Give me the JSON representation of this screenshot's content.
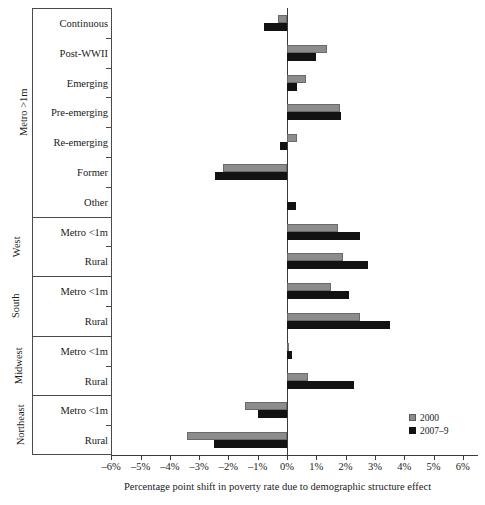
{
  "chart_data": {
    "type": "bar",
    "orientation": "horizontal",
    "title": "",
    "xlabel": "Percentage point shift in poverty rate due to demographic structure effect",
    "ylabel": "",
    "xlim": [
      -6.5,
      6.5
    ],
    "xticks": [
      "-6%",
      "-5%",
      "-4%",
      "-3%",
      "-2%",
      "-1%",
      "0%",
      "1%",
      "2%",
      "3%",
      "4%",
      "5%",
      "6%"
    ],
    "xtick_values": [
      -6,
      -5,
      -4,
      -3,
      -2,
      -1,
      0,
      1,
      2,
      3,
      4,
      5,
      6
    ],
    "grid": false,
    "legend_position": "bottom-right",
    "categories": [
      "Continuous",
      "Post-WWII",
      "Emerging",
      "Pre-emerging",
      "Re-emerging",
      "Former",
      "Other",
      "Metro <1m",
      "Rural",
      "Metro <1m",
      "Rural",
      "Metro <1m",
      "Rural",
      "Metro <1m",
      "Rural"
    ],
    "groups": [
      {
        "label": "Metro >1m",
        "start": 0,
        "count": 7
      },
      {
        "label": "West",
        "start": 7,
        "count": 2
      },
      {
        "label": "South",
        "start": 9,
        "count": 2
      },
      {
        "label": "Midwest",
        "start": 11,
        "count": 2
      },
      {
        "label": "Northeast",
        "start": 13,
        "count": 2
      }
    ],
    "series": [
      {
        "name": "2000",
        "color": "#8c8c8c",
        "values": [
          -0.3,
          1.35,
          0.65,
          1.8,
          0.35,
          -2.2,
          0.0,
          1.75,
          1.9,
          1.5,
          2.5,
          0.02,
          0.7,
          -1.45,
          -3.4
        ]
      },
      {
        "name": "2007–9",
        "color": "#121212",
        "values": [
          -0.8,
          1.0,
          0.33,
          1.85,
          -0.25,
          -2.45,
          0.3,
          2.5,
          2.75,
          2.1,
          3.5,
          0.16,
          2.3,
          -1.0,
          -2.5
        ]
      }
    ]
  },
  "legend": {
    "items": [
      {
        "label": "2000",
        "color": "#8c8c8c"
      },
      {
        "label": "2007–9",
        "color": "#121212"
      }
    ]
  }
}
